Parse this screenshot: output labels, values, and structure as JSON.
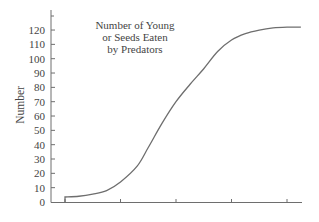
{
  "chart_data": {
    "type": "line",
    "title": [
      "Number of Young",
      "or Seeds Eaten",
      "by Predators"
    ],
    "xlabel": "",
    "ylabel": "Number",
    "ylim": [
      0,
      130
    ],
    "yticks": [
      0,
      10,
      20,
      30,
      40,
      50,
      60,
      70,
      80,
      90,
      100,
      110,
      120
    ],
    "xticks": [
      0,
      1,
      2,
      3,
      4
    ],
    "xtick_labels": [],
    "grid": false,
    "legend": null,
    "series": [
      {
        "name": "Number of Young or Seeds Eaten by Predators",
        "x": [
          0,
          0.25,
          0.5,
          0.75,
          1.0,
          1.3,
          1.5,
          1.75,
          2.0,
          2.25,
          2.5,
          2.75,
          3.0,
          3.25,
          3.5,
          3.75,
          4.0,
          4.25
        ],
        "values": [
          3.5,
          4,
          5.5,
          8,
          14,
          25,
          38,
          55,
          70,
          82,
          93,
          105,
          113,
          117.5,
          120,
          121.5,
          122,
          122
        ],
        "color": "#6e6e6e"
      }
    ],
    "colors": {
      "line": "#6e6e6e",
      "axis": "#6e6e6e",
      "text": "#444444",
      "background": "#ffffff"
    }
  }
}
